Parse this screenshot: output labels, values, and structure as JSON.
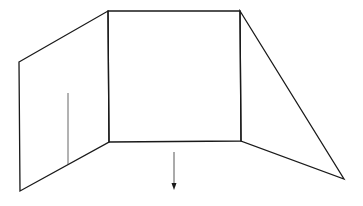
{
  "diagram": {
    "stroke_color": "#1a1a1a",
    "thin_stroke_color": "#555555",
    "panels": {
      "left": {
        "points": [
          [
            19,
            62
          ],
          [
            108,
            11
          ],
          [
            109,
            142
          ],
          [
            20,
            191
          ]
        ]
      },
      "center": {
        "points": [
          [
            108,
            11
          ],
          [
            240,
            11
          ],
          [
            241,
            141
          ],
          [
            109,
            142
          ]
        ]
      },
      "right": {
        "points": [
          [
            240,
            11
          ],
          [
            344,
            179
          ],
          [
            241,
            141
          ]
        ]
      }
    },
    "divider_line": {
      "x1": 68,
      "y1": 93,
      "x2": 68,
      "y2": 164
    },
    "arrow": {
      "x": 174,
      "y1": 152,
      "y2": 190,
      "direction": "down"
    }
  }
}
